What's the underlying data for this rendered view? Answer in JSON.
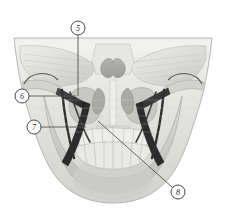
{
  "figure": {
    "background_color": "#ffffff",
    "width": 226,
    "height": 214
  },
  "illustration": {
    "subject": "human-skull-frontal",
    "style": "grayscale-anatomical-halftone",
    "structures": [
      {
        "name": "frontal-bone",
        "tone": "#e8e8e6"
      },
      {
        "name": "orbital-roof-left",
        "tone": "#dcdcda"
      },
      {
        "name": "orbital-roof-right",
        "tone": "#dcdcda"
      },
      {
        "name": "nasal-cavity",
        "tone": "#bdbdbb"
      },
      {
        "name": "nasal-concha",
        "tone": "#a9a9a7"
      },
      {
        "name": "maxilla",
        "tone": "#d6d6d3"
      },
      {
        "name": "zygomatic-arch-left",
        "tone": "#cfcfcc"
      },
      {
        "name": "zygomatic-arch-right",
        "tone": "#cfcfcc"
      },
      {
        "name": "mandible",
        "tone": "#cbcbc8"
      },
      {
        "name": "maxillary-teeth",
        "tone": "#efefec"
      },
      {
        "name": "mandibular-teeth",
        "tone": "#ebebe8"
      },
      {
        "name": "lateral-pterygoid-left",
        "tone": "#3a3a3a"
      },
      {
        "name": "lateral-pterygoid-right",
        "tone": "#3a3a3a"
      },
      {
        "name": "medial-pterygoid-left",
        "tone": "#2e2e2e"
      },
      {
        "name": "medial-pterygoid-right",
        "tone": "#2e2e2e"
      },
      {
        "name": "stylomandibular-ligament-left",
        "tone": "#333333"
      },
      {
        "name": "stylomandibular-ligament-right",
        "tone": "#333333"
      }
    ]
  },
  "callouts": [
    {
      "id": "callout-5",
      "number": "5",
      "circle": {
        "cx": 78,
        "cy": 28,
        "r": 7
      },
      "leader": {
        "x1": 78,
        "y1": 35,
        "x2": 78,
        "y2": 96
      },
      "leader_style": "vertical"
    },
    {
      "id": "callout-6",
      "number": "6",
      "circle": {
        "cx": 22,
        "cy": 96,
        "r": 7
      },
      "leader": {
        "x1": 29,
        "y1": 96,
        "x2": 76,
        "y2": 96
      },
      "leader_style": "horizontal"
    },
    {
      "id": "callout-7",
      "number": "7",
      "circle": {
        "cx": 34,
        "cy": 127,
        "r": 7
      },
      "leader": {
        "x1": 41,
        "y1": 127,
        "x2": 86,
        "y2": 127
      },
      "leader_style": "horizontal"
    },
    {
      "id": "callout-8",
      "number": "8",
      "circle": {
        "cx": 178,
        "cy": 192,
        "r": 7
      },
      "leader": {
        "x1": 172,
        "y1": 187,
        "x2": 98,
        "y2": 121
      },
      "leader_style": "diagonal"
    }
  ],
  "colors": {
    "callout_circle_stroke": "#4a4a4a",
    "callout_circle_fill": "#ffffff",
    "callout_text": "#2a2a2a",
    "leader_line": "#555555",
    "bone_light": "#f2f2f0",
    "bone_mid": "#d8d8d5",
    "bone_dark": "#b0b0ad",
    "muscle_dark": "#333333",
    "outline": "#9a9a97"
  }
}
